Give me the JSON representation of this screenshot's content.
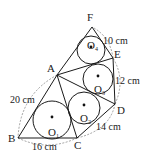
{
  "vertices": [
    {
      "name": "F",
      "x": 92,
      "y": 27,
      "lx": 87,
      "ly": 21
    },
    {
      "name": "E",
      "x": 113,
      "y": 58,
      "lx": 114,
      "ly": 58
    },
    {
      "name": "A",
      "x": 57,
      "y": 75,
      "lx": 47,
      "ly": 72
    },
    {
      "name": "D",
      "x": 115,
      "y": 104,
      "lx": 117,
      "ly": 114
    },
    {
      "name": "C",
      "x": 77,
      "y": 138,
      "lx": 74,
      "ly": 149
    },
    {
      "name": "B",
      "x": 18,
      "y": 138,
      "lx": 8,
      "ly": 142
    }
  ],
  "circles": [
    {
      "name": "O",
      "sub": "1",
      "cx": 52,
      "cy": 120,
      "r": 19,
      "lx": 48,
      "ly": 136
    },
    {
      "name": "O",
      "sub": "2",
      "cx": 84,
      "cy": 108,
      "r": 16,
      "lx": 80,
      "ly": 122
    },
    {
      "name": "O",
      "sub": "3",
      "cx": 98,
      "cy": 79,
      "r": 15,
      "lx": 94,
      "ly": 93
    },
    {
      "name": "O",
      "sub": "4",
      "cx": 91,
      "cy": 50,
      "r": 14,
      "lx": 87,
      "ly": 49
    }
  ],
  "lengths": [
    {
      "text": "10 cm",
      "x": 103,
      "y": 44
    },
    {
      "text": "12 cm",
      "x": 115,
      "y": 84
    },
    {
      "text": "20 cm",
      "x": 10,
      "y": 103
    },
    {
      "text": "14 cm",
      "x": 96,
      "y": 130
    },
    {
      "text": "16 cm",
      "x": 32,
      "y": 150
    }
  ],
  "edges": [
    [
      "B",
      "C"
    ],
    [
      "B",
      "A"
    ],
    [
      "A",
      "C"
    ],
    [
      "C",
      "D"
    ],
    [
      "A",
      "D"
    ],
    [
      "D",
      "E"
    ],
    [
      "A",
      "E"
    ],
    [
      "E",
      "F"
    ],
    [
      "A",
      "F"
    ]
  ]
}
